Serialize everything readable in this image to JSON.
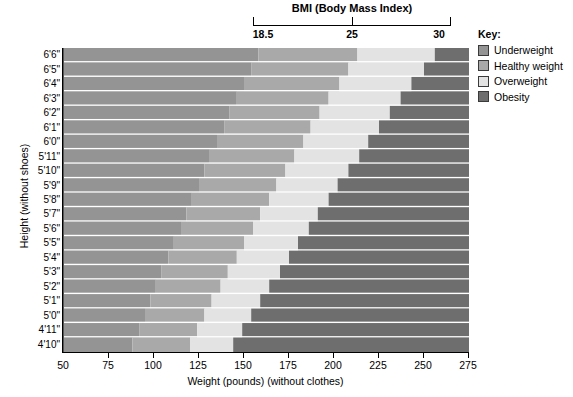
{
  "bmi_scale": {
    "title": "BMI (Body Mass Index)",
    "ticks": [
      {
        "label": "18.5",
        "value": 18.5
      },
      {
        "label": "25",
        "value": 25
      },
      {
        "label": "30",
        "value": 30
      }
    ]
  },
  "key": {
    "title": "Key:",
    "items": [
      {
        "label": "Underweight",
        "color": "#949494"
      },
      {
        "label": "Healthy weight",
        "color": "#a9a9a9"
      },
      {
        "label": "Overweight",
        "color": "#e3e3e3"
      },
      {
        "label": "Obesity",
        "color": "#6e6e6e"
      }
    ]
  },
  "axes": {
    "x_title": "Weight (pounds) (without clothes)",
    "y_title": "Height (without shoes)",
    "x_ticks": [
      "50",
      "75",
      "100",
      "125",
      "150",
      "175",
      "200",
      "225",
      "250",
      "275"
    ],
    "y_ticks": [
      "6'6\"",
      "6'5\"",
      "6'4\"",
      "6'3\"",
      "6'2\"",
      "6'1\"",
      "6'0\"",
      "5'11\"",
      "5'10\"",
      "5'9\"",
      "5'8\"",
      "5'7\"",
      "5'6\"",
      "5'5\"",
      "5'4\"",
      "5'3\"",
      "5'2\"",
      "5'1\"",
      "5'0\"",
      "4'11\"",
      "4'10\""
    ]
  },
  "chart_data": {
    "type": "heatmap",
    "title": "BMI (Body Mass Index)",
    "xlabel": "Weight (pounds) (without clothes)",
    "ylabel": "Height (without shoes)",
    "xlim": [
      50,
      275
    ],
    "grid": false,
    "legend_position": "right",
    "categories": [
      "6'6\"",
      "6'5\"",
      "6'4\"",
      "6'3\"",
      "6'2\"",
      "6'1\"",
      "6'0\"",
      "5'11\"",
      "5'10\"",
      "5'9\"",
      "5'8\"",
      "5'7\"",
      "5'6\"",
      "5'5\"",
      "5'4\"",
      "5'3\"",
      "5'2\"",
      "5'1\"",
      "5'0\"",
      "4'11\"",
      "4'10\""
    ],
    "heights_inches": [
      78,
      77,
      76,
      75,
      74,
      73,
      72,
      71,
      70,
      69,
      68,
      67,
      66,
      65,
      64,
      63,
      62,
      61,
      60,
      59,
      58
    ],
    "bmi_thresholds": [
      18.5,
      25,
      30
    ],
    "bands": [
      {
        "name": "Underweight",
        "bmi_range": [
          0,
          18.5
        ],
        "color": "#949494"
      },
      {
        "name": "Healthy weight",
        "bmi_range": [
          18.5,
          25
        ],
        "color": "#a9a9a9"
      },
      {
        "name": "Overweight",
        "bmi_range": [
          25,
          30
        ],
        "color": "#e3e3e3"
      },
      {
        "name": "Obesity",
        "bmi_range": [
          30,
          100
        ],
        "color": "#6e6e6e"
      }
    ],
    "series": [
      {
        "name": "Underweight upper bound (lbs)",
        "values": [
          158,
          154,
          150,
          146,
          142,
          139,
          135,
          131,
          128,
          125,
          121,
          118,
          115,
          111,
          108,
          104,
          101,
          98,
          95,
          92,
          88
        ]
      },
      {
        "name": "Healthy upper bound (lbs)",
        "values": [
          213,
          208,
          203,
          197,
          192,
          187,
          183,
          178,
          173,
          168,
          164,
          159,
          155,
          150,
          146,
          141,
          137,
          132,
          128,
          124,
          120
        ]
      },
      {
        "name": "Overweight upper bound (lbs)",
        "values": [
          256,
          250,
          243,
          237,
          231,
          225,
          219,
          214,
          208,
          202,
          197,
          191,
          186,
          180,
          175,
          170,
          164,
          159,
          154,
          149,
          144
        ]
      }
    ]
  }
}
